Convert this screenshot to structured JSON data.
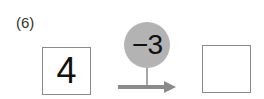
{
  "problem": {
    "label": "(6)",
    "input_value": "4",
    "operation": "−3",
    "output_value": "",
    "colors": {
      "circle": "#b3b3b3",
      "arrow": "#8a8a8a",
      "box_border": "#8a8a8a"
    }
  }
}
